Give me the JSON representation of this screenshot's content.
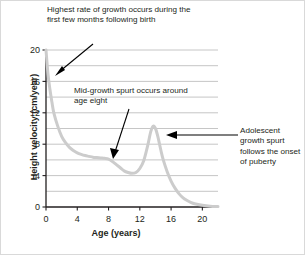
{
  "figure": {
    "title_alt": "Human height velocity curve",
    "background": "#ffffff",
    "border_color": "#d9d9d9"
  },
  "annotations": {
    "top": "Highest rate of growth occurs during the first few months following birth",
    "mid": "Mid-growth spurt occurs around age eight",
    "adolescent": "Adolescent growth spurt follows the onset of puberty"
  },
  "chart_data": {
    "type": "line",
    "title": "",
    "xlabel": "Age (years)",
    "ylabel": "Height velocity (cm/year)",
    "xlim": [
      0,
      22
    ],
    "ylim": [
      0,
      20
    ],
    "xticks": [
      0,
      4,
      8,
      12,
      16,
      20
    ],
    "yticks": [
      0,
      4,
      8,
      12,
      16,
      20
    ],
    "y_minor_gridlines": [
      2,
      4,
      6,
      8,
      10,
      12,
      14,
      16,
      18
    ],
    "grid": true,
    "grid_color": "#bfbfbf",
    "legend": "none",
    "line_color": "#cccccc",
    "line_width": 3,
    "series": [
      {
        "name": "Height velocity",
        "x": [
          0,
          0.25,
          0.5,
          0.75,
          1,
          1.5,
          2,
          2.5,
          3,
          3.5,
          4,
          4.5,
          5,
          5.5,
          6,
          6.5,
          7,
          7.5,
          8,
          8.5,
          9,
          9.5,
          10,
          10.5,
          11,
          11.5,
          12,
          12.5,
          13,
          13.4,
          13.7,
          14,
          14.3,
          14.7,
          15,
          15.5,
          16,
          16.5,
          17,
          17.5,
          18,
          18.5,
          19,
          20,
          21,
          22
        ],
        "values": [
          20.0,
          17.0,
          15.0,
          13.4,
          12.0,
          10.3,
          9.0,
          8.2,
          7.6,
          7.2,
          6.9,
          6.7,
          6.55,
          6.45,
          6.35,
          6.3,
          6.25,
          6.2,
          6.1,
          5.8,
          5.4,
          5.0,
          4.6,
          4.4,
          4.3,
          4.4,
          4.9,
          5.9,
          7.8,
          9.6,
          10.3,
          10.0,
          9.0,
          7.2,
          6.0,
          4.5,
          3.3,
          2.4,
          1.7,
          1.2,
          0.85,
          0.6,
          0.42,
          0.22,
          0.1,
          0.05
        ]
      }
    ],
    "annotation_points": [
      {
        "label": "Highest rate of growth occurs during the first few months following birth",
        "x": 0.35,
        "y": 16.3
      },
      {
        "label": "Mid-growth spurt occurs around age eight",
        "x": 8.0,
        "y": 6.2
      },
      {
        "label": "Adolescent growth spurt follows the onset of puberty",
        "x": 14.3,
        "y": 9.9
      }
    ]
  },
  "axes": {
    "x_tick_labels": [
      "0",
      "4",
      "8",
      "12",
      "16",
      "20"
    ],
    "y_tick_labels": [
      "0",
      "4",
      "8",
      "12",
      "16",
      "20"
    ]
  }
}
